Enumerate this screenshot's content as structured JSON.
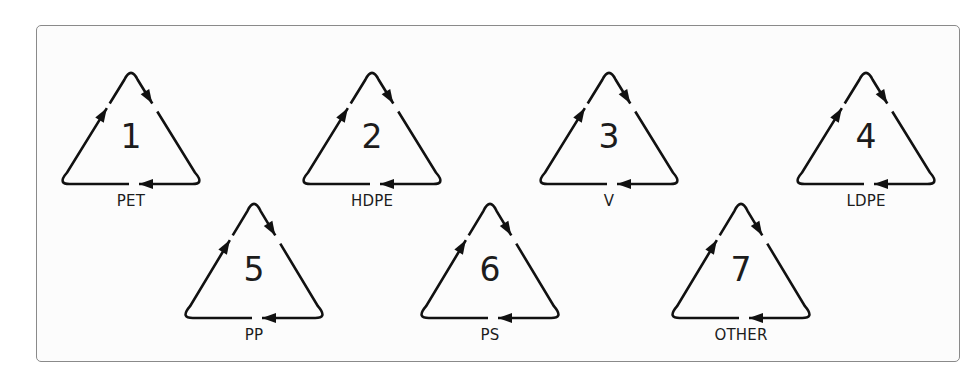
{
  "symbols": [
    {
      "number": "1",
      "label": "PET",
      "cx": 131,
      "apex_y": 69,
      "base_y": 184
    },
    {
      "number": "2",
      "label": "HDPE",
      "cx": 372,
      "apex_y": 69,
      "base_y": 184
    },
    {
      "number": "3",
      "label": "V",
      "cx": 609,
      "apex_y": 69,
      "base_y": 184
    },
    {
      "number": "4",
      "label": "LDPE",
      "cx": 866,
      "apex_y": 69,
      "base_y": 184
    },
    {
      "number": "5",
      "label": "PP",
      "cx": 254,
      "apex_y": 200,
      "base_y": 318
    },
    {
      "number": "6",
      "label": "PS",
      "cx": 490,
      "apex_y": 200,
      "base_y": 318
    },
    {
      "number": "7",
      "label": "OTHER",
      "cx": 741,
      "apex_y": 200,
      "base_y": 318
    }
  ],
  "colors": {
    "stroke": "#111111",
    "panel_border": "#8a8a8a",
    "text": "#1c1c1c"
  }
}
